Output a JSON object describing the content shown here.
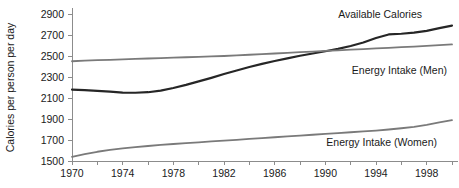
{
  "chart_data": {
    "type": "line",
    "title": "",
    "xlabel": "",
    "ylabel": "Calories per person per day",
    "xlim": [
      1970,
      2000
    ],
    "ylim": [
      1500,
      2900
    ],
    "grid": false,
    "legend_position": "inline-annotations",
    "y_ticks": [
      1500,
      1700,
      1900,
      2100,
      2300,
      2500,
      2700,
      2900
    ],
    "x_ticks": [
      1970,
      1972,
      1974,
      1976,
      1978,
      1980,
      1982,
      1984,
      1986,
      1988,
      1990,
      1992,
      1994,
      1996,
      1998,
      2000
    ],
    "x_tick_labels": [
      "1970",
      "",
      "1974",
      "",
      "1978",
      "",
      "1982",
      "",
      "1986",
      "",
      "1990",
      "",
      "1994",
      "",
      "1998",
      ""
    ],
    "x": [
      1970,
      1971,
      1972,
      1973,
      1974,
      1975,
      1976,
      1977,
      1978,
      1979,
      1980,
      1981,
      1982,
      1983,
      1984,
      1985,
      1986,
      1987,
      1988,
      1989,
      1990,
      1991,
      1992,
      1993,
      1994,
      1995,
      1996,
      1997,
      1998,
      1999,
      2000
    ],
    "series": [
      {
        "name": "Available Calories",
        "color": "#262626",
        "width": 2.2,
        "label_x": 2000,
        "values": [
          2180,
          2175,
          2168,
          2160,
          2152,
          2150,
          2155,
          2170,
          2195,
          2225,
          2258,
          2292,
          2328,
          2362,
          2395,
          2425,
          2452,
          2478,
          2502,
          2524,
          2545,
          2568,
          2595,
          2628,
          2672,
          2705,
          2712,
          2722,
          2740,
          2765,
          2790
        ]
      },
      {
        "name": "Energy Intake (Men)",
        "color": "#7a7a7a",
        "width": 1.8,
        "label_x": 1995,
        "values": [
          2450,
          2455,
          2460,
          2464,
          2468,
          2472,
          2476,
          2480,
          2484,
          2488,
          2492,
          2496,
          2500,
          2506,
          2512,
          2518,
          2524,
          2530,
          2536,
          2542,
          2548,
          2554,
          2560,
          2566,
          2572,
          2578,
          2584,
          2590,
          2596,
          2603,
          2610
        ]
      },
      {
        "name": "Energy Intake (Women)",
        "color": "#7a7a7a",
        "width": 1.8,
        "label_x": 1992,
        "values": [
          1540,
          1565,
          1588,
          1605,
          1620,
          1632,
          1643,
          1653,
          1662,
          1670,
          1678,
          1686,
          1694,
          1702,
          1710,
          1718,
          1726,
          1734,
          1742,
          1750,
          1758,
          1766,
          1774,
          1782,
          1790,
          1800,
          1812,
          1826,
          1845,
          1868,
          1890
        ]
      }
    ],
    "annotations": [
      {
        "text": "Available Calories",
        "x": 422,
        "y": 18,
        "anchor": "end"
      },
      {
        "text": "Energy Intake (Men)",
        "x": 447,
        "y": 74,
        "anchor": "end"
      },
      {
        "text": "Energy Intake (Women)",
        "x": 437,
        "y": 146,
        "anchor": "end"
      }
    ]
  }
}
